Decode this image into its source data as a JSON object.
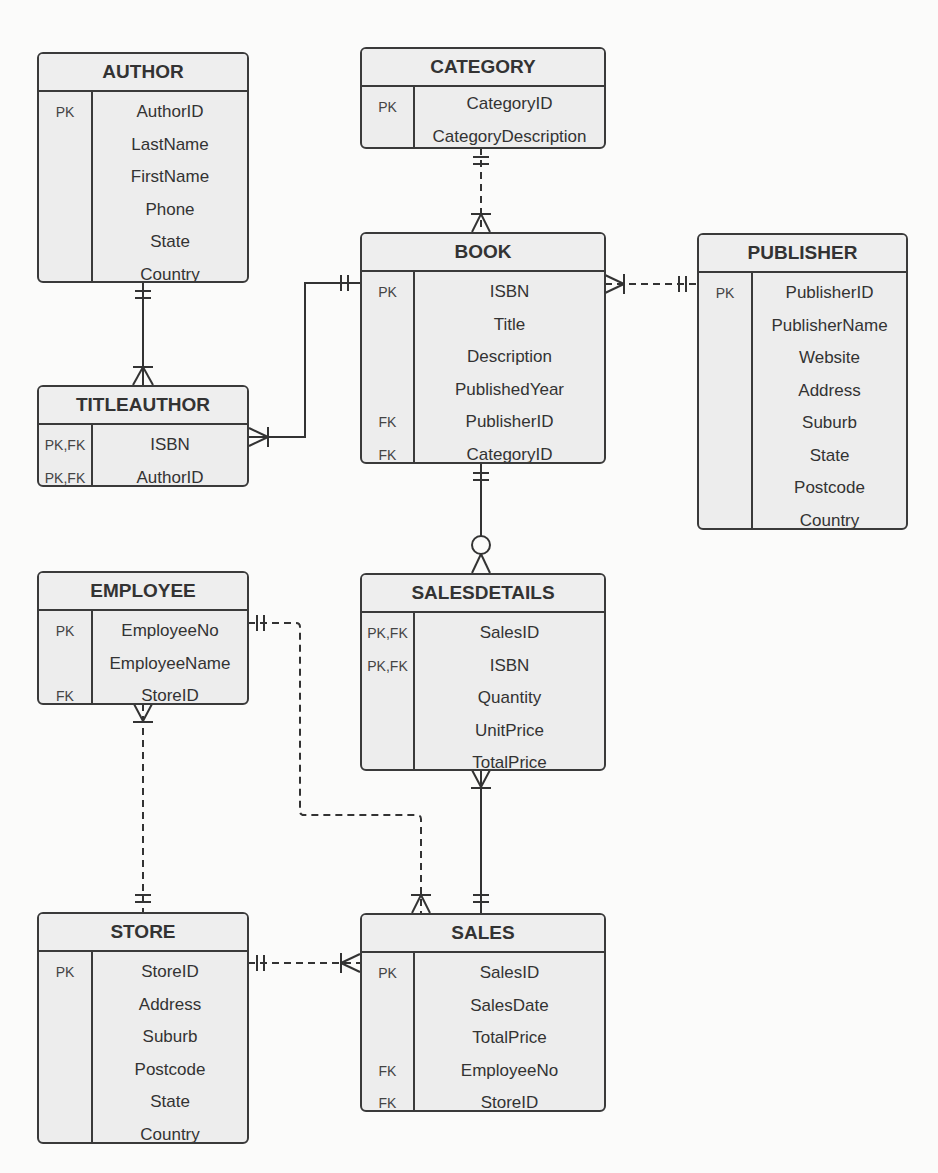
{
  "diagram": {
    "type": "entity-relationship",
    "entities": {
      "author": {
        "name": "AUTHOR",
        "rows": [
          {
            "key": "PK",
            "attr": "AuthorID"
          },
          {
            "key": "",
            "attr": "LastName"
          },
          {
            "key": "",
            "attr": "FirstName"
          },
          {
            "key": "",
            "attr": "Phone"
          },
          {
            "key": "",
            "attr": "State"
          },
          {
            "key": "",
            "attr": "Country"
          }
        ]
      },
      "category": {
        "name": "CATEGORY",
        "rows": [
          {
            "key": "PK",
            "attr": "CategoryID"
          },
          {
            "key": "",
            "attr": "CategoryDescription"
          }
        ]
      },
      "book": {
        "name": "BOOK",
        "rows": [
          {
            "key": "PK",
            "attr": "ISBN"
          },
          {
            "key": "",
            "attr": "Title"
          },
          {
            "key": "",
            "attr": "Description"
          },
          {
            "key": "",
            "attr": "PublishedYear"
          },
          {
            "key": "FK",
            "attr": "PublisherID"
          },
          {
            "key": "FK",
            "attr": "CategoryID"
          }
        ]
      },
      "publisher": {
        "name": "PUBLISHER",
        "rows": [
          {
            "key": "PK",
            "attr": "PublisherID"
          },
          {
            "key": "",
            "attr": "PublisherName"
          },
          {
            "key": "",
            "attr": "Website"
          },
          {
            "key": "",
            "attr": "Address"
          },
          {
            "key": "",
            "attr": "Suburb"
          },
          {
            "key": "",
            "attr": "State"
          },
          {
            "key": "",
            "attr": "Postcode"
          },
          {
            "key": "",
            "attr": "Country"
          }
        ]
      },
      "titleauthor": {
        "name": "TITLEAUTHOR",
        "rows": [
          {
            "key": "PK,FK",
            "attr": "ISBN"
          },
          {
            "key": "PK,FK",
            "attr": "AuthorID"
          }
        ]
      },
      "employee": {
        "name": "EMPLOYEE",
        "rows": [
          {
            "key": "PK",
            "attr": "EmployeeNo"
          },
          {
            "key": "",
            "attr": "EmployeeName"
          },
          {
            "key": "FK",
            "attr": "StoreID"
          }
        ]
      },
      "salesdetails": {
        "name": "SALESDETAILS",
        "rows": [
          {
            "key": "PK,FK",
            "attr": "SalesID"
          },
          {
            "key": "PK,FK",
            "attr": "ISBN"
          },
          {
            "key": "",
            "attr": "Quantity"
          },
          {
            "key": "",
            "attr": "UnitPrice"
          },
          {
            "key": "",
            "attr": "TotalPrice"
          }
        ]
      },
      "store": {
        "name": "STORE",
        "rows": [
          {
            "key": "PK",
            "attr": "StoreID"
          },
          {
            "key": "",
            "attr": "Address"
          },
          {
            "key": "",
            "attr": "Suburb"
          },
          {
            "key": "",
            "attr": "Postcode"
          },
          {
            "key": "",
            "attr": "State"
          },
          {
            "key": "",
            "attr": "Country"
          }
        ]
      },
      "sales": {
        "name": "SALES",
        "rows": [
          {
            "key": "PK",
            "attr": "SalesID"
          },
          {
            "key": "",
            "attr": "SalesDate"
          },
          {
            "key": "",
            "attr": "TotalPrice"
          },
          {
            "key": "FK",
            "attr": "EmployeeNo"
          },
          {
            "key": "FK",
            "attr": "StoreID"
          }
        ]
      }
    },
    "relationships": [
      {
        "from": "AUTHOR",
        "to": "TITLEAUTHOR",
        "from_card": "one-and-only-one",
        "to_card": "one-or-many",
        "line": "solid"
      },
      {
        "from": "BOOK",
        "to": "TITLEAUTHOR",
        "from_card": "one-and-only-one",
        "to_card": "one-or-many",
        "line": "solid"
      },
      {
        "from": "CATEGORY",
        "to": "BOOK",
        "from_card": "one-and-only-one",
        "to_card": "one-or-many",
        "line": "dashed"
      },
      {
        "from": "PUBLISHER",
        "to": "BOOK",
        "from_card": "one-and-only-one",
        "to_card": "one-or-many",
        "line": "dashed"
      },
      {
        "from": "BOOK",
        "to": "SALESDETAILS",
        "from_card": "one-and-only-one",
        "to_card": "zero-or-many",
        "line": "solid"
      },
      {
        "from": "SALES",
        "to": "SALESDETAILS",
        "from_card": "one-and-only-one",
        "to_card": "one-or-many",
        "line": "solid"
      },
      {
        "from": "EMPLOYEE",
        "to": "SALES",
        "from_card": "one-and-only-one",
        "to_card": "one-or-many",
        "line": "dashed"
      },
      {
        "from": "STORE",
        "to": "EMPLOYEE",
        "from_card": "one-and-only-one",
        "to_card": "one-or-many",
        "line": "dashed"
      },
      {
        "from": "STORE",
        "to": "SALES",
        "from_card": "one-and-only-one",
        "to_card": "one-or-many",
        "line": "dashed"
      }
    ]
  }
}
